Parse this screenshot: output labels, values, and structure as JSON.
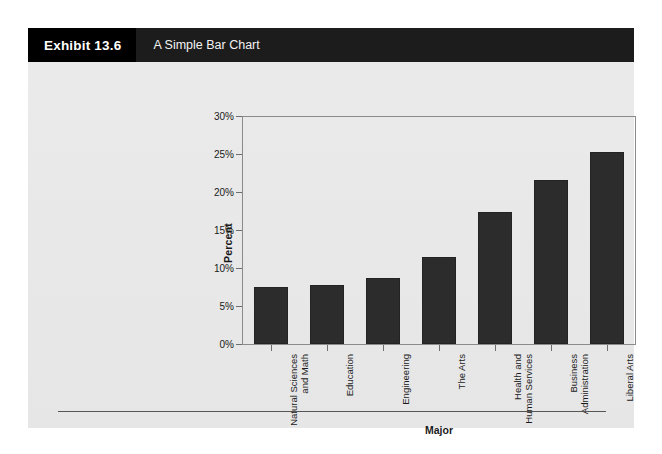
{
  "exhibit": {
    "tag": "Exhibit 13.6",
    "title": "A Simple Bar Chart"
  },
  "chart_data": {
    "type": "bar",
    "title": "A Simple Bar Chart",
    "xlabel": "Major",
    "ylabel": "Percent",
    "grid": false,
    "legend": "none",
    "ylim": [
      0,
      30
    ],
    "ytick_labels": [
      "0%",
      "5%",
      "10%",
      "15%",
      "20%",
      "25%",
      "30%"
    ],
    "ytick_values": [
      0,
      5,
      10,
      15,
      20,
      25,
      30
    ],
    "value_suffix": "%",
    "bar_color": "#2c2c2c",
    "bar_edge_color": "#232323",
    "categories": [
      "Natural Sciences and Math",
      "Education",
      "Engineering",
      "The Arts",
      "Health and Human Services",
      "Business Administration",
      "Liberal Arts"
    ],
    "category_lines": [
      [
        "Natural Sciences",
        "and Math"
      ],
      [
        "Education"
      ],
      [
        "Engineering"
      ],
      [
        "The Arts"
      ],
      [
        "Health and",
        "Human Services"
      ],
      [
        "Business",
        "Administration"
      ],
      [
        "Liberal Arts"
      ]
    ],
    "values": [
      7.5,
      7.8,
      8.7,
      11.4,
      17.4,
      21.6,
      25.2
    ]
  }
}
